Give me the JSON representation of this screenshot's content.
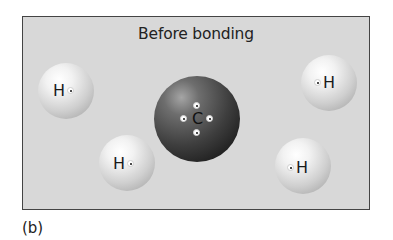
{
  "diagram": {
    "title": "Before bonding",
    "panel_label": "(b)",
    "atoms": [
      {
        "id": "h1",
        "symbol": "H",
        "electron_side": "right"
      },
      {
        "id": "h2",
        "symbol": "H",
        "electron_side": "right"
      },
      {
        "id": "c",
        "symbol": "C",
        "electrons": 4
      },
      {
        "id": "h3",
        "symbol": "H",
        "electron_side": "left"
      },
      {
        "id": "h4",
        "symbol": "H",
        "electron_side": "left"
      }
    ],
    "colors": {
      "background": "#d8d8d8",
      "border": "#444444",
      "hydrogen": "#e0e0e0",
      "carbon": "#3a3a3a"
    }
  }
}
